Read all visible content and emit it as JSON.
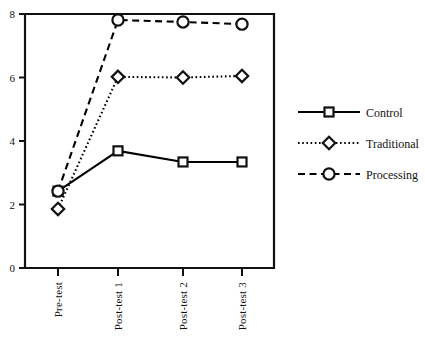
{
  "chart_data": {
    "type": "line",
    "title": "",
    "xlabel": "",
    "ylabel": "",
    "categories": [
      "Pre-test",
      "Post-test 1",
      "Post-test 2",
      "Post-test 3"
    ],
    "ylim": [
      0,
      8
    ],
    "yticks": [
      "0",
      "2",
      "4",
      "6",
      "8"
    ],
    "ytick_values": [
      0,
      2,
      4,
      6,
      8
    ],
    "grid": false,
    "legend_position": "right",
    "series": [
      {
        "name": "Control",
        "values": [
          2.42,
          3.69,
          3.34,
          3.34
        ],
        "marker": "square",
        "linestyle": "solid",
        "color": "#000000"
      },
      {
        "name": "Traditional",
        "values": [
          1.86,
          6.02,
          6.0,
          6.05
        ],
        "marker": "diamond",
        "linestyle": "dotted",
        "color": "#000000"
      },
      {
        "name": "Processing",
        "values": [
          2.42,
          7.81,
          7.75,
          7.68
        ],
        "marker": "circle",
        "linestyle": "dashed",
        "color": "#000000"
      }
    ]
  },
  "legend": {
    "items": [
      {
        "label": "Control"
      },
      {
        "label": "Traditional"
      },
      {
        "label": "Processing"
      }
    ]
  },
  "axis": {
    "y_tick_labels": [
      "8",
      "6",
      "4",
      "2",
      "0"
    ],
    "x_tick_labels": [
      "Pre-test",
      "Post-test 1",
      "Post-test 2",
      "Post-test 3"
    ]
  }
}
